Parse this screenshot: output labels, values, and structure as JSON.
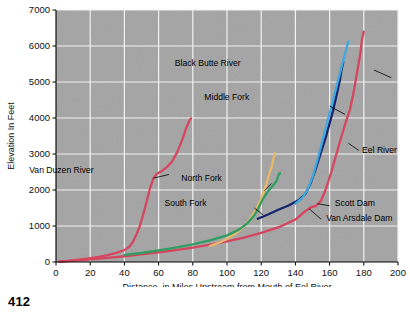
{
  "page": {
    "number": "412"
  },
  "chart_data": {
    "type": "line",
    "title": "",
    "xlabel": "Distance, in Miles Upstream from Mouth of Eel River",
    "ylabel": "Elevation In Feet",
    "xlim": [
      0,
      200
    ],
    "ylim": [
      0,
      7000
    ],
    "xticks": [
      0,
      20,
      40,
      60,
      80,
      100,
      120,
      140,
      160,
      180,
      200
    ],
    "xtick_labels": [
      "0",
      "20",
      "40",
      "60",
      "80",
      "100",
      "120",
      "140",
      "160",
      "180",
      "200"
    ],
    "yticks": [
      0,
      1000,
      2000,
      3000,
      4000,
      5000,
      6000,
      7000
    ],
    "ytick_labels": [
      "0",
      "1000",
      "2000",
      "3000",
      "4000",
      "5000",
      "6000",
      "7000"
    ],
    "grid": true,
    "legend_position": "inline-annotations",
    "plot_background": "#a8a8a8",
    "gridline_color": "#f2f2f2",
    "series": [
      {
        "name": "Eel River",
        "color": "#d6455e",
        "label": "Eel River",
        "points": [
          [
            2,
            10
          ],
          [
            10,
            40
          ],
          [
            20,
            75
          ],
          [
            30,
            115
          ],
          [
            40,
            160
          ],
          [
            50,
            210
          ],
          [
            60,
            265
          ],
          [
            70,
            330
          ],
          [
            80,
            400
          ],
          [
            90,
            480
          ],
          [
            100,
            570
          ],
          [
            110,
            680
          ],
          [
            120,
            810
          ],
          [
            130,
            960
          ],
          [
            140,
            1180
          ],
          [
            146,
            1420
          ],
          [
            149,
            1520
          ],
          [
            152,
            1560
          ],
          [
            155,
            1700
          ],
          [
            158,
            2050
          ],
          [
            161,
            2500
          ],
          [
            164,
            3000
          ],
          [
            167,
            3500
          ],
          [
            170,
            3960
          ],
          [
            172,
            4250
          ],
          [
            174,
            4700
          ],
          [
            176,
            5250
          ],
          [
            178,
            5800
          ],
          [
            179,
            6200
          ],
          [
            180,
            6400
          ]
        ]
      },
      {
        "name": "Van Duzen River",
        "color": "#d6455e",
        "label": "Van Duzen River",
        "points": [
          [
            2,
            10
          ],
          [
            10,
            45
          ],
          [
            18,
            90
          ],
          [
            25,
            140
          ],
          [
            30,
            190
          ],
          [
            35,
            250
          ],
          [
            40,
            330
          ],
          [
            43,
            430
          ],
          [
            45,
            560
          ],
          [
            47,
            760
          ],
          [
            49,
            1000
          ],
          [
            51,
            1320
          ],
          [
            53,
            1680
          ],
          [
            55,
            2050
          ],
          [
            57,
            2330
          ],
          [
            59,
            2450
          ],
          [
            62,
            2530
          ],
          [
            65,
            2640
          ],
          [
            68,
            2800
          ],
          [
            71,
            3060
          ],
          [
            74,
            3420
          ],
          [
            76,
            3700
          ],
          [
            78,
            3930
          ],
          [
            79,
            3990
          ]
        ]
      },
      {
        "name": "North Fork",
        "color": "#e8b96a",
        "label": "North Fork",
        "points": [
          [
            90,
            440
          ],
          [
            95,
            530
          ],
          [
            100,
            640
          ],
          [
            105,
            790
          ],
          [
            110,
            990
          ],
          [
            114,
            1230
          ],
          [
            117,
            1470
          ],
          [
            120,
            1760
          ],
          [
            122,
            2020
          ],
          [
            124,
            2330
          ],
          [
            126,
            2620
          ],
          [
            127,
            2840
          ],
          [
            128,
            3020
          ]
        ]
      },
      {
        "name": "South Fork",
        "color": "#2f9e62",
        "label": "South Fork",
        "points": [
          [
            40,
            195
          ],
          [
            50,
            250
          ],
          [
            60,
            320
          ],
          [
            70,
            400
          ],
          [
            80,
            490
          ],
          [
            90,
            600
          ],
          [
            100,
            740
          ],
          [
            107,
            900
          ],
          [
            112,
            1080
          ],
          [
            116,
            1300
          ],
          [
            119,
            1560
          ],
          [
            121,
            1750
          ],
          [
            123,
            1900
          ],
          [
            125,
            2020
          ],
          [
            127,
            2130
          ],
          [
            129,
            2250
          ],
          [
            130,
            2400
          ],
          [
            131,
            2470
          ]
        ]
      },
      {
        "name": "Middle Fork",
        "color": "#16246e",
        "label": "Middle Fork",
        "points": [
          [
            118,
            1200
          ],
          [
            124,
            1320
          ],
          [
            130,
            1450
          ],
          [
            136,
            1570
          ],
          [
            142,
            1720
          ],
          [
            146,
            1900
          ],
          [
            149,
            2200
          ],
          [
            152,
            2600
          ],
          [
            155,
            3050
          ],
          [
            158,
            3500
          ],
          [
            160,
            3850
          ],
          [
            162,
            4200
          ],
          [
            164,
            4620
          ],
          [
            166,
            5050
          ],
          [
            167,
            5350
          ],
          [
            168,
            5550
          ]
        ]
      },
      {
        "name": "Black Butte River",
        "color": "#3ea8e0",
        "label": "Black Butte River",
        "points": [
          [
            140,
            1620
          ],
          [
            144,
            1780
          ],
          [
            147,
            2000
          ],
          [
            150,
            2350
          ],
          [
            153,
            2850
          ],
          [
            156,
            3400
          ],
          [
            159,
            3950
          ],
          [
            162,
            4500
          ],
          [
            165,
            5050
          ],
          [
            168,
            5600
          ],
          [
            170,
            5950
          ],
          [
            171,
            6120
          ]
        ]
      }
    ],
    "annotations": [
      {
        "text": "Black Butte River",
        "x": 108,
        "y": 5450
      },
      {
        "text": "Middle Fork",
        "x": 113,
        "y": 4500
      },
      {
        "text": "Eel River",
        "x": 179,
        "y": 3030
      },
      {
        "text": "Van Duzen River",
        "x": 22,
        "y": 2480
      },
      {
        "text": "North Fork",
        "x": 97,
        "y": 2250
      },
      {
        "text": "South Fork",
        "x": 88,
        "y": 1550
      },
      {
        "text": "Scott Dam",
        "x": 163,
        "y": 1550
      },
      {
        "text": "Van Arsdale Dam",
        "x": 158,
        "y": 1130
      }
    ]
  }
}
